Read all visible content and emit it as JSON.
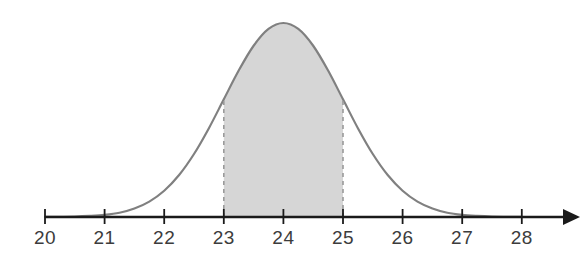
{
  "figure": {
    "background_color": "#ffffff",
    "width": 587,
    "height": 257
  },
  "axis": {
    "label_20": "20",
    "label_21": "21",
    "label_22": "22",
    "label_23": "23",
    "label_24": "24",
    "label_25": "25",
    "label_26": "26",
    "label_27": "27",
    "label_28": "28",
    "line_color": "#1a1a1a",
    "tick_color": "#1a1a1a",
    "label_color": "#3c3c3c"
  },
  "curve": {
    "stroke_color": "#808080",
    "fill_color": "#d6d6d6",
    "dashed_color": "#9a9a9a"
  },
  "chart_data": {
    "type": "area",
    "title": "",
    "subtitle": "",
    "xlabel": "",
    "ylabel": "",
    "grid": false,
    "legend": "none",
    "distribution": "normal",
    "mean": 24,
    "std_dev": 1,
    "xlim": [
      20,
      28
    ],
    "ylim": [
      0,
      0.42
    ],
    "x_ticks": [
      20,
      21,
      22,
      23,
      24,
      25,
      26,
      27,
      28
    ],
    "x_tick_labels": [
      "20",
      "21",
      "22",
      "23",
      "24",
      "25",
      "26",
      "27",
      "28"
    ],
    "y_ticks": [],
    "y_tick_labels": [],
    "shaded_region": {
      "from": 23,
      "to": 25,
      "fill": "#d6d6d6",
      "boundary_style": "dashed",
      "boundary_labels": [
        "23",
        "25"
      ],
      "approx_area": 0.68
    },
    "annotations": [],
    "x": [
      20.0,
      20.25,
      20.5,
      20.75,
      21.0,
      21.25,
      21.5,
      21.75,
      22.0,
      22.25,
      22.5,
      22.75,
      23.0,
      23.25,
      23.5,
      23.75,
      24.0,
      24.25,
      24.5,
      24.75,
      25.0,
      25.25,
      25.5,
      25.75,
      26.0,
      26.25,
      26.5,
      26.75,
      27.0,
      27.25,
      27.5,
      27.75,
      28.0
    ],
    "y": [
      0.0001,
      0.0004,
      0.0009,
      0.0022,
      0.0044,
      0.0088,
      0.0175,
      0.0317,
      0.054,
      0.0863,
      0.1295,
      0.1826,
      0.242,
      0.3011,
      0.3521,
      0.3867,
      0.3989,
      0.3867,
      0.3521,
      0.3011,
      0.242,
      0.1826,
      0.1295,
      0.0863,
      0.054,
      0.0317,
      0.0175,
      0.0088,
      0.0044,
      0.0022,
      0.0009,
      0.0004,
      0.0001
    ]
  }
}
